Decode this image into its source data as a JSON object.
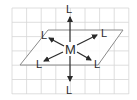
{
  "diagram": {
    "title": "",
    "colors": {
      "grid": "#d0d0d0",
      "plane": "#888888",
      "arrow": "#2a2a2a",
      "text": "#2a2a2a",
      "background": "#ffffff"
    },
    "grid": {
      "x0": 12,
      "y0": 8,
      "cols": 8,
      "rows": 6,
      "cell": 14.6
    },
    "plane_points": "48,30 123,30 98,65 20,65",
    "center": {
      "label": "M",
      "x": 70,
      "y": 49
    },
    "ligands": [
      {
        "id": "top",
        "label": "L",
        "x": 70,
        "y": 16,
        "lx": 67,
        "ly": 12
      },
      {
        "id": "bottom",
        "label": "L",
        "x": 70,
        "y": 82,
        "lx": 67,
        "ly": 93
      },
      {
        "id": "upper-left",
        "label": "L",
        "x": 48,
        "y": 38,
        "lx": 41,
        "ly": 39
      },
      {
        "id": "upper-right",
        "label": "L",
        "x": 98,
        "y": 35,
        "lx": 101,
        "ly": 36
      },
      {
        "id": "lower-left",
        "label": "L",
        "x": 43,
        "y": 61,
        "lx": 36,
        "ly": 67
      },
      {
        "id": "lower-right",
        "label": "L",
        "x": 92,
        "y": 60,
        "lx": 94,
        "ly": 67
      }
    ]
  }
}
